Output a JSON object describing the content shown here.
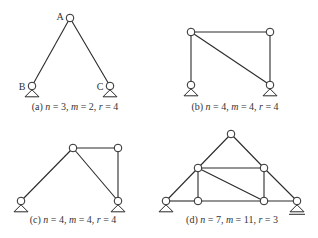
{
  "figure": {
    "panels": [
      {
        "id": "a",
        "caption": {
          "prefix": "(a) ",
          "n": "3",
          "m": "2",
          "r": "4"
        },
        "node_labels": [
          "A",
          "B",
          "C"
        ],
        "nodes": [
          [
            70,
            18
          ],
          [
            32,
            86
          ],
          [
            110,
            86
          ]
        ],
        "members": [
          [
            0,
            1
          ],
          [
            0,
            2
          ]
        ],
        "supports": [
          {
            "node": 1,
            "type": "pin"
          },
          {
            "node": 2,
            "type": "pin"
          }
        ]
      },
      {
        "id": "b",
        "caption": {
          "prefix": "(b) ",
          "n": "4",
          "m": "4",
          "r": "4"
        },
        "nodes": [
          [
            191,
            32
          ],
          [
            270,
            32
          ],
          [
            191,
            85
          ],
          [
            270,
            85
          ]
        ],
        "members": [
          [
            0,
            1
          ],
          [
            0,
            2
          ],
          [
            1,
            3
          ],
          [
            0,
            3
          ]
        ],
        "supports": [
          {
            "node": 2,
            "type": "pin"
          },
          {
            "node": 3,
            "type": "pin"
          }
        ]
      },
      {
        "id": "c",
        "caption": {
          "prefix": "(c) ",
          "n": "4",
          "m": "4",
          "r": "4"
        },
        "nodes": [
          [
            73,
            148
          ],
          [
            118,
            148
          ],
          [
            21,
            201
          ],
          [
            118,
            201
          ]
        ],
        "members": [
          [
            0,
            1
          ],
          [
            0,
            2
          ],
          [
            0,
            3
          ],
          [
            1,
            3
          ]
        ],
        "supports": [
          {
            "node": 2,
            "type": "pin"
          },
          {
            "node": 3,
            "type": "pin"
          }
        ]
      },
      {
        "id": "d",
        "caption": {
          "prefix": "(d) ",
          "n": "7",
          "m": "11",
          "r": "3"
        },
        "nodes": [
          [
            231,
            134
          ],
          [
            198,
            168
          ],
          [
            264,
            168
          ],
          [
            166,
            201
          ],
          [
            198,
            201
          ],
          [
            264,
            201
          ],
          [
            297,
            201
          ]
        ],
        "members": [
          [
            0,
            1
          ],
          [
            0,
            2
          ],
          [
            1,
            3
          ],
          [
            2,
            6
          ],
          [
            1,
            2
          ],
          [
            1,
            4
          ],
          [
            2,
            5
          ],
          [
            1,
            5
          ],
          [
            3,
            4
          ],
          [
            4,
            5
          ],
          [
            5,
            6
          ]
        ],
        "supports": [
          {
            "node": 3,
            "type": "pin"
          },
          {
            "node": 6,
            "type": "roller"
          }
        ]
      }
    ],
    "caption_labels": {
      "n": "n",
      "m": "m",
      "r": "r",
      "eq": " = ",
      "sep": ", "
    }
  }
}
